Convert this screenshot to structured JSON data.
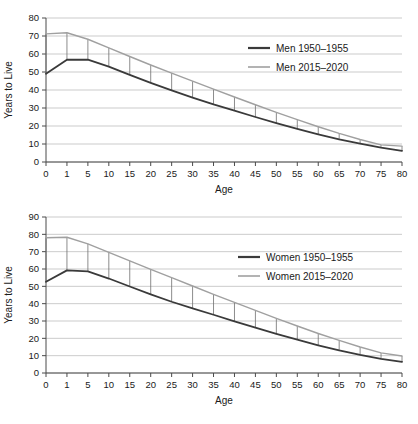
{
  "figure": {
    "title": "",
    "panels": [
      "men",
      "women"
    ]
  },
  "chart_data": [
    {
      "id": "men",
      "type": "line",
      "title": "",
      "xlabel": "Age",
      "ylabel": "Years to Live",
      "categories": [
        "0",
        "1",
        "5",
        "10",
        "15",
        "20",
        "25",
        "30",
        "35",
        "40",
        "45",
        "50",
        "55",
        "60",
        "65",
        "70",
        "75",
        "80"
      ],
      "xticklabels": [
        "0",
        "1",
        "5",
        "10",
        "15",
        "20",
        "25",
        "30",
        "35",
        "40",
        "45",
        "50",
        "55",
        "60",
        "65",
        "70",
        "75",
        "80"
      ],
      "yticklabels": [
        "0",
        "10",
        "20",
        "30",
        "40",
        "50",
        "60",
        "70",
        "80"
      ],
      "ylim": [
        0,
        80
      ],
      "yticks": [
        0,
        10,
        20,
        30,
        40,
        50,
        60,
        70,
        80
      ],
      "grid": true,
      "legend_position": "upper right",
      "series": [
        {
          "name": "Men 1950–1955",
          "color": "#3a3a3a",
          "values": [
            49.0,
            56.8,
            56.9,
            53.0,
            48.4,
            44.0,
            39.8,
            35.8,
            32.0,
            28.5,
            25.0,
            21.6,
            18.4,
            15.4,
            12.6,
            10.2,
            8.0,
            6.2
          ]
        },
        {
          "name": "Men 2015–2020",
          "color": "#a0a0a0",
          "values": [
            71.2,
            71.8,
            68.2,
            63.4,
            58.6,
            53.9,
            49.4,
            44.9,
            40.5,
            36.1,
            31.8,
            27.6,
            23.5,
            19.6,
            15.9,
            12.5,
            9.5,
            8.8
          ]
        }
      ],
      "connectors": true
    },
    {
      "id": "women",
      "type": "line",
      "title": "",
      "xlabel": "Age",
      "ylabel": "Years to Live",
      "categories": [
        "0",
        "1",
        "5",
        "10",
        "15",
        "20",
        "25",
        "30",
        "35",
        "40",
        "45",
        "50",
        "55",
        "60",
        "65",
        "70",
        "75",
        "80"
      ],
      "xticklabels": [
        "0",
        "1",
        "5",
        "10",
        "15",
        "20",
        "25",
        "30",
        "35",
        "40",
        "45",
        "50",
        "55",
        "60",
        "65",
        "70",
        "75",
        "80"
      ],
      "yticklabels": [
        "0",
        "10",
        "20",
        "30",
        "40",
        "50",
        "60",
        "70",
        "80",
        "90"
      ],
      "ylim": [
        0,
        90
      ],
      "yticks": [
        0,
        10,
        20,
        30,
        40,
        50,
        60,
        70,
        80,
        90
      ],
      "grid": true,
      "legend_position": "upper right",
      "series": [
        {
          "name": "Women 1950–1955",
          "color": "#3a3a3a",
          "values": [
            52.6,
            59.2,
            58.6,
            54.5,
            49.9,
            45.4,
            41.1,
            37.3,
            33.6,
            29.8,
            26.2,
            22.6,
            19.2,
            16.0,
            13.0,
            10.4,
            8.1,
            6.4
          ]
        },
        {
          "name": "Women 2015–2020",
          "color": "#a0a0a0",
          "values": [
            78.0,
            78.3,
            74.5,
            69.6,
            64.7,
            59.8,
            55.0,
            50.2,
            45.4,
            40.7,
            36.1,
            31.5,
            27.1,
            22.8,
            18.8,
            15.0,
            11.6,
            9.8
          ]
        }
      ],
      "connectors": true
    }
  ],
  "colors": {
    "series_dark": "#3a3a3a",
    "series_light": "#a0a0a0",
    "grid": "#b6b6b6",
    "axis": "#4a4a4a",
    "text": "#1a1a1a",
    "background": "#ffffff"
  }
}
